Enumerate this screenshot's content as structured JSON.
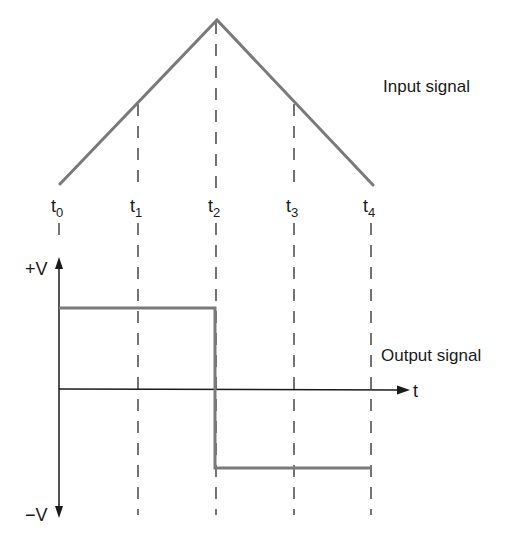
{
  "labels": {
    "input_signal": "Input signal",
    "output_signal": "Output signal",
    "plus_v": "+V",
    "minus_v": "−V",
    "time_axis": "t"
  },
  "time_marks": [
    {
      "base": "t",
      "sub": "0",
      "x": 59
    },
    {
      "base": "t",
      "sub": "1",
      "x": 138
    },
    {
      "base": "t",
      "sub": "2",
      "x": 216
    },
    {
      "base": "t",
      "sub": "3",
      "x": 294
    },
    {
      "base": "t",
      "sub": "4",
      "x": 371
    }
  ],
  "input_waveform": {
    "type": "triangle",
    "points": [
      [
        60,
        184
      ],
      [
        217,
        20
      ],
      [
        373,
        185
      ]
    ]
  },
  "output_waveform": {
    "type": "square",
    "high_level": "+V",
    "low_level": "-V",
    "transition_at": "t2",
    "points": [
      [
        59,
        308
      ],
      [
        215,
        308
      ],
      [
        215,
        468
      ],
      [
        371,
        468
      ]
    ]
  },
  "colors": {
    "signal": "#7a7a7a",
    "axis": "#1a1a1a",
    "background": "#ffffff"
  }
}
